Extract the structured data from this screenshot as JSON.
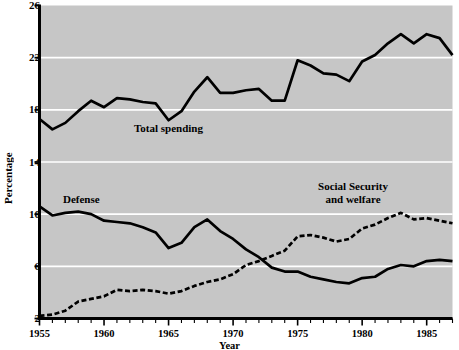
{
  "chart_data": {
    "type": "line",
    "title": "",
    "xlabel": "Year",
    "ylabel": "Percentage",
    "xlim": [
      1955,
      1987
    ],
    "ylim": [
      2,
      26
    ],
    "ytick_labels": [
      "26",
      "22",
      "18",
      "14",
      "10",
      "6",
      "2"
    ],
    "ytick_values": [
      26,
      22,
      18,
      14,
      10,
      6,
      2
    ],
    "xtick_labels": [
      "1955",
      "1960",
      "1965",
      "1970",
      "1975",
      "1980",
      "1985"
    ],
    "xtick_values": [
      1955,
      1960,
      1965,
      1970,
      1975,
      1980,
      1985
    ],
    "grid": "horizontal-white-gridlines",
    "legend_position": "inline-annotations",
    "plot_background": "#c6c6c6",
    "line_color": "#000000",
    "gridline_color": "#ffffff",
    "x": [
      1955,
      1956,
      1957,
      1958,
      1959,
      1960,
      1961,
      1962,
      1963,
      1964,
      1965,
      1966,
      1967,
      1968,
      1969,
      1970,
      1971,
      1972,
      1973,
      1974,
      1975,
      1976,
      1977,
      1978,
      1979,
      1980,
      1981,
      1982,
      1983,
      1984,
      1985,
      1986,
      1987
    ],
    "series": [
      {
        "name": "Total spending",
        "style": "solid",
        "values": [
          17.3,
          16.5,
          17.0,
          17.9,
          18.7,
          18.2,
          18.9,
          18.8,
          18.6,
          18.5,
          17.2,
          17.9,
          19.4,
          20.5,
          19.3,
          19.3,
          19.5,
          19.6,
          18.7,
          18.7,
          21.8,
          21.4,
          20.8,
          20.7,
          20.2,
          21.7,
          22.2,
          23.1,
          23.8,
          23.1,
          23.8,
          23.5,
          22.2
        ]
      },
      {
        "name": "Defense",
        "style": "solid",
        "values": [
          10.6,
          9.9,
          10.1,
          10.2,
          10.0,
          9.5,
          9.4,
          9.3,
          9.0,
          8.6,
          7.4,
          7.8,
          9.0,
          9.6,
          8.7,
          8.1,
          7.3,
          6.7,
          5.9,
          5.6,
          5.6,
          5.2,
          5.0,
          4.8,
          4.7,
          5.1,
          5.2,
          5.8,
          6.1,
          6.0,
          6.4,
          6.5,
          6.4
        ]
      },
      {
        "name": "Social Security and welfare",
        "style": "dashed",
        "values": [
          2.2,
          2.3,
          2.6,
          3.3,
          3.5,
          3.7,
          4.2,
          4.1,
          4.2,
          4.1,
          3.9,
          4.1,
          4.5,
          4.8,
          5.0,
          5.4,
          6.1,
          6.4,
          6.8,
          7.2,
          8.3,
          8.4,
          8.2,
          7.9,
          8.1,
          8.9,
          9.2,
          9.7,
          10.1,
          9.6,
          9.7,
          9.5,
          9.3
        ]
      }
    ]
  },
  "annotations": {
    "total": "Total spending",
    "defense": "Defense",
    "social_security": "Social Security\nand welfare"
  }
}
